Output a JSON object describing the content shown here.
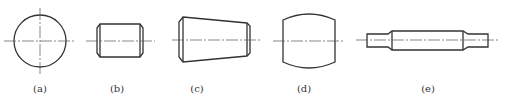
{
  "figure": {
    "panels": [
      {
        "id": "a",
        "label": "(a)",
        "shape": "circle"
      },
      {
        "id": "b",
        "label": "(b)",
        "shape": "cylinder-with-chamfers"
      },
      {
        "id": "c",
        "label": "(c)",
        "shape": "tapered-cylinder-with-chamfers"
      },
      {
        "id": "d",
        "label": "(d)",
        "shape": "barrel"
      },
      {
        "id": "e",
        "label": "(e)",
        "shape": "stepped-shaft"
      }
    ],
    "colors": {
      "stroke": "#333333",
      "centerline": "#555555",
      "background": "#ffffff"
    }
  }
}
